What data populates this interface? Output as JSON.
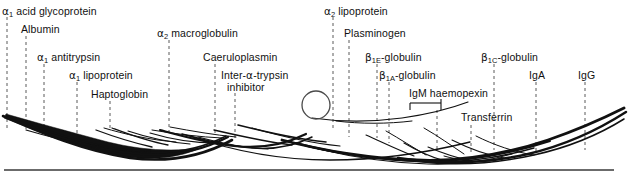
{
  "figure": {
    "background_color": "#ffffff",
    "ink_color": "#111111",
    "leader_line_color": "#5a5a5a"
  },
  "labels": [
    {
      "id": "a1-acid-glycoprotein",
      "text": "α₁ acid glycoprotein",
      "html": "<span class='greek'>α</span><sub>1</sub> acid glycoprotein",
      "x": 2,
      "y": 6,
      "clipped_left": true
    },
    {
      "id": "albumin",
      "text": "Albumin",
      "html": "Albumin",
      "x": 21,
      "y": 24
    },
    {
      "id": "a1-antitrypsin",
      "text": "α₁ antitrypsin",
      "html": "<span class='greek'>α</span><sub>1</sub> antitrypsin",
      "x": 37,
      "y": 52
    },
    {
      "id": "a1-lipoprotein",
      "text": "α₁ lipoprotein",
      "html": "<span class='greek'>α</span><sub>1</sub> lipoprotein",
      "x": 69,
      "y": 70
    },
    {
      "id": "haptoglobin",
      "text": "Haptoglobin",
      "html": "Haptoglobin",
      "x": 91,
      "y": 89
    },
    {
      "id": "a2-macroglobulin",
      "text": "α₂ macroglobulin",
      "html": "<span class='greek'>α</span><sub>2</sub> macroglobulin",
      "x": 157,
      "y": 28
    },
    {
      "id": "caeruloplasmin",
      "text": "Caeruloplasmin",
      "html": "Caeruloplasmin",
      "x": 203,
      "y": 52
    },
    {
      "id": "inter-a-trypsin-inhibitor",
      "text": "Inter-α-trypsin inhibitor",
      "html": "Inter-<span class='greek'>α</span>-trypsin<br>&nbsp;&nbsp;inhibitor",
      "x": 221,
      "y": 70,
      "two_line": true
    },
    {
      "id": "a2-lipoprotein",
      "text": "α₂ lipoprotein",
      "html": "<span class='greek'>α</span><sub>2</sub> lipoprotein",
      "x": 324,
      "y": 6
    },
    {
      "id": "plasminogen",
      "text": "Plasminogen",
      "html": "Plasminogen",
      "x": 344,
      "y": 28
    },
    {
      "id": "b1e-globulin",
      "text": "β₁E-globulin",
      "html": "<span class='greek'>β</span><sub>1E</sub>-globulin",
      "x": 365,
      "y": 52
    },
    {
      "id": "b1a-globulin",
      "text": "β₁A-globulin",
      "html": "<span class='greek'>β</span><sub>1A</sub>-globulin",
      "x": 379,
      "y": 70
    },
    {
      "id": "igm-haemopexin",
      "text": "IgM haemopexin",
      "html": "IgM haemopexin",
      "x": 409,
      "y": 91
    },
    {
      "id": "transferrin",
      "text": "Transferrin",
      "html": "Transferrin",
      "x": 461,
      "y": 113
    },
    {
      "id": "b1c-globulin",
      "text": "β₁C-globulin",
      "html": "<span class='greek'>β</span><sub>1C</sub>-globulin",
      "x": 481,
      "y": 52
    },
    {
      "id": "iga",
      "text": "IgA",
      "html": "IgA",
      "x": 529,
      "y": 70
    },
    {
      "id": "igg",
      "text": "IgG",
      "html": "IgG",
      "x": 578,
      "y": 70
    }
  ],
  "leader_lines": [
    {
      "id": "leader-a1-acid-glycoprotein",
      "x": 7,
      "y1": 17,
      "y2": 130
    },
    {
      "id": "leader-albumin",
      "x": 26,
      "y1": 36,
      "y2": 131
    },
    {
      "id": "leader-a1-antitrypsin",
      "x": 44,
      "y1": 64,
      "y2": 133
    },
    {
      "id": "leader-a1-lipoprotein",
      "x": 77,
      "y1": 82,
      "y2": 134
    },
    {
      "id": "leader-haptoglobin",
      "x": 110,
      "y1": 101,
      "y2": 130
    },
    {
      "id": "leader-a2-macroglobulin",
      "x": 169,
      "y1": 40,
      "y2": 136
    },
    {
      "id": "leader-caeruloplasmin",
      "x": 215,
      "y1": 64,
      "y2": 136
    },
    {
      "id": "leader-inter-a-trypsin-inhibitor",
      "x": 235,
      "y1": 93,
      "y2": 138
    },
    {
      "id": "leader-a2-lipoprotein",
      "x": 333,
      "y1": 17,
      "y2": 130
    },
    {
      "id": "leader-plasminogen",
      "x": 349,
      "y1": 40,
      "y2": 137
    },
    {
      "id": "leader-b1e-globulin",
      "x": 377,
      "y1": 64,
      "y2": 138
    },
    {
      "id": "leader-b1a-globulin",
      "x": 389,
      "y1": 82,
      "y2": 143
    },
    {
      "id": "leader-igm-haemopexin",
      "x": 437,
      "y1": 103,
      "y2": 150
    },
    {
      "id": "leader-transferrin",
      "x": 471,
      "y1": 125,
      "y2": 152
    },
    {
      "id": "leader-b1c-globulin",
      "x": 494,
      "y1": 64,
      "y2": 150
    },
    {
      "id": "leader-iga",
      "x": 536,
      "y1": 82,
      "y2": 152
    },
    {
      "id": "leader-igg",
      "x": 585,
      "y1": 82,
      "y2": 150
    }
  ],
  "baseline": {
    "id": "baseline",
    "x1": 4,
    "x2": 614,
    "y": 170
  },
  "sample_well": {
    "id": "sample-well",
    "cx": 316,
    "cy": 105,
    "r": 14
  },
  "haemopexin_bracket": {
    "x1": 410,
    "x2": 441,
    "y": 103,
    "tick_height": 7
  },
  "chart_data": {
    "type": "diagram-arcs",
    "filled_arc": {
      "name": "albumin-band",
      "note": "solid black lens-shaped albumin precipitin arc on left"
    },
    "arc_count": 17
  }
}
